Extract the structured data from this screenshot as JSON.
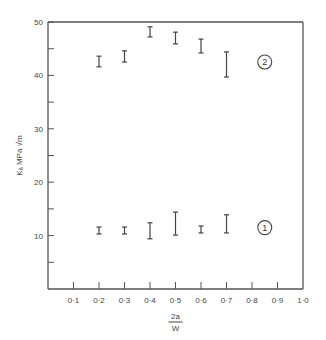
{
  "chart_data": {
    "type": "scatter",
    "title": "",
    "xlabel_numerator": "2a",
    "xlabel_denominator": "W",
    "ylabel": "Kₐ MPa √m",
    "xlim": [
      0,
      1.0
    ],
    "ylim": [
      0,
      50
    ],
    "x_ticks": [
      0.1,
      0.2,
      0.3,
      0.4,
      0.5,
      0.6,
      0.7,
      0.8,
      0.9,
      1.0
    ],
    "x_tick_labels": [
      "0·1",
      "0·2",
      "0·3",
      "0·4",
      "0·5",
      "0·6",
      "0·7",
      "0·8",
      "0·9",
      "1·0"
    ],
    "y_ticks": [
      5,
      10,
      15,
      20,
      25,
      30,
      35,
      40,
      45,
      50
    ],
    "y_tick_labels": {
      "10": "10",
      "20": "20",
      "30": "30",
      "40": "40",
      "50": "50"
    },
    "grid": false,
    "series": [
      {
        "name": "2",
        "label": "2",
        "style": "error-bar range",
        "points": [
          {
            "x": 0.2,
            "low": 41.6,
            "high": 43.6
          },
          {
            "x": 0.3,
            "low": 42.5,
            "high": 44.6
          },
          {
            "x": 0.4,
            "low": 47.2,
            "high": 49.1
          },
          {
            "x": 0.5,
            "low": 45.9,
            "high": 48.1
          },
          {
            "x": 0.6,
            "low": 44.2,
            "high": 46.8
          },
          {
            "x": 0.7,
            "low": 39.7,
            "high": 44.4
          }
        ],
        "annotation_x": 0.85,
        "annotation_y": 42.5
      },
      {
        "name": "1",
        "label": "1",
        "style": "error-bar range",
        "points": [
          {
            "x": 0.2,
            "low": 10.3,
            "high": 11.6
          },
          {
            "x": 0.3,
            "low": 10.3,
            "high": 11.6
          },
          {
            "x": 0.4,
            "low": 9.4,
            "high": 12.4
          },
          {
            "x": 0.5,
            "low": 10.1,
            "high": 14.4
          },
          {
            "x": 0.6,
            "low": 10.5,
            "high": 11.8
          },
          {
            "x": 0.7,
            "low": 10.5,
            "high": 13.9
          }
        ],
        "annotation_x": 0.85,
        "annotation_y": 11.5
      }
    ]
  }
}
